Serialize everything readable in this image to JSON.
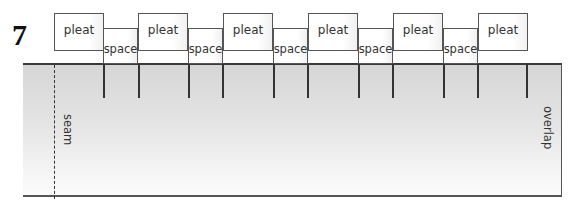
{
  "step": {
    "number": "7"
  },
  "top_row": {
    "boxes": [
      {
        "type": "pleat",
        "label": "pleat",
        "x": 54
      },
      {
        "type": "space",
        "label": "space",
        "x": 103
      },
      {
        "type": "pleat",
        "label": "pleat",
        "x": 138
      },
      {
        "type": "space",
        "label": "space",
        "x": 188
      },
      {
        "type": "pleat",
        "label": "pleat",
        "x": 223
      },
      {
        "type": "space",
        "label": "space",
        "x": 273
      },
      {
        "type": "pleat",
        "label": "pleat",
        "x": 308
      },
      {
        "type": "space",
        "label": "space",
        "x": 358
      },
      {
        "type": "pleat",
        "label": "pleat",
        "x": 393
      },
      {
        "type": "space",
        "label": "space",
        "x": 443
      },
      {
        "type": "pleat",
        "label": "pleat",
        "x": 478
      }
    ]
  },
  "fabric": {
    "tick_positions": [
      103,
      138,
      188,
      223,
      273,
      308,
      358,
      393,
      443,
      478,
      527
    ],
    "seam_label": "seam",
    "overlap_label": "overlap"
  }
}
